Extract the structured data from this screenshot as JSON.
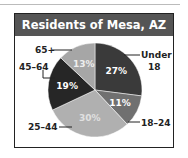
{
  "chart_data": {
    "type": "pie",
    "title": "Residents of Mesa, AZ",
    "categories": [
      "Under 18",
      "18–24",
      "25–44",
      "45–64",
      "65+"
    ],
    "values": [
      27,
      11,
      30,
      19,
      13
    ],
    "labels": [
      "27%",
      "11%",
      "30%",
      "19%",
      "13%"
    ],
    "colors": [
      "#3a3a3a",
      "#707070",
      "#b0b0b0",
      "#262626",
      "#a6a6a6"
    ],
    "legend": "callout labels"
  },
  "labels": {
    "under18_line1": "Under",
    "under18_line2": "18",
    "age18_24": "18–24",
    "age25_44": "25–44",
    "age45_64": "45–64",
    "age65": "65+"
  }
}
